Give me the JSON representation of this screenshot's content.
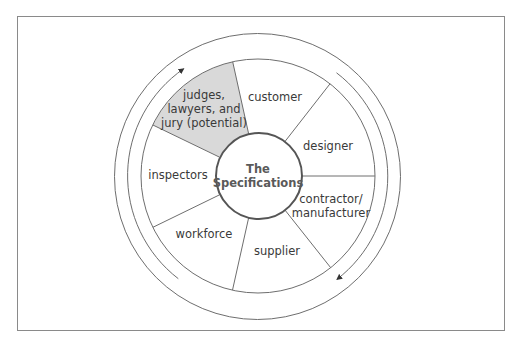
{
  "diagram": {
    "title": "The Specifications",
    "hub": {
      "line1": "The",
      "line2": "Specifications"
    },
    "sectors": [
      {
        "id": "judges",
        "line1": "judges,",
        "line2": "lawyers, and",
        "line3": "jury (potential)",
        "highlighted": true
      },
      {
        "id": "customer",
        "label": "customer"
      },
      {
        "id": "designer",
        "label": "designer"
      },
      {
        "id": "contractor",
        "line1": "contractor/",
        "line2": "manufacturer"
      },
      {
        "id": "supplier",
        "label": "supplier"
      },
      {
        "id": "workforce",
        "label": "workforce"
      },
      {
        "id": "inspectors",
        "label": "inspectors"
      }
    ],
    "arrows": [
      {
        "side": "left",
        "direction": "clockwise-upward"
      },
      {
        "side": "right",
        "direction": "clockwise-downward"
      }
    ],
    "colors": {
      "line": "#6e6e6e",
      "hub_stroke": "#555555",
      "highlight_fill": "#d9d9d9",
      "text": "#3a3a3a"
    }
  }
}
